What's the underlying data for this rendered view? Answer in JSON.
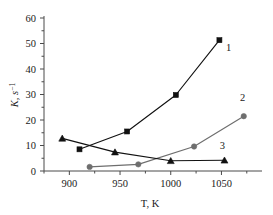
{
  "chart_data": {
    "type": "line",
    "title": "",
    "xlabel": "T, K",
    "ylabel": "K, s",
    "ylabel_sup": "-1",
    "xlim": [
      875,
      1090
    ],
    "ylim": [
      0,
      60
    ],
    "xticks": [
      900,
      950,
      1000,
      1050
    ],
    "yticks": [
      0,
      10,
      20,
      30,
      40,
      50,
      60
    ],
    "grid": false,
    "legend_position": "inline-right-labels",
    "series": [
      {
        "name": "1",
        "marker": "square",
        "color": "#111111",
        "x": [
          910,
          957,
          1005,
          1048
        ],
        "y": [
          8.5,
          15.5,
          29.8,
          51.3
        ]
      },
      {
        "name": "2",
        "marker": "circle",
        "color": "#6e6e6e",
        "x": [
          920,
          968,
          1023,
          1072
        ],
        "y": [
          1.6,
          2.6,
          9.6,
          21.5
        ]
      },
      {
        "name": "3",
        "marker": "triangle",
        "color": "#111111",
        "x": [
          893,
          945,
          1000,
          1053
        ],
        "y": [
          12.8,
          7.4,
          4.0,
          4.2
        ]
      }
    ],
    "annotations": [
      {
        "text": "1",
        "x": 1057,
        "y": 47.0
      },
      {
        "text": "2",
        "x": 1071,
        "y": 27.5
      },
      {
        "text": "3",
        "x": 1051,
        "y": 8.8
      }
    ]
  },
  "axis": {
    "x_title": "T, K",
    "y_title_base": "K, s",
    "y_title_exp": "−1",
    "x_tick_labels": [
      "900",
      "950",
      "1000",
      "1050"
    ],
    "y_tick_labels": [
      "0",
      "10",
      "20",
      "30",
      "40",
      "50",
      "60"
    ]
  },
  "colors": {
    "series1": "#111111",
    "series2": "#6e6e6e",
    "series3": "#111111",
    "axis": "#4a4a4a",
    "text": "#1a1a1a",
    "background": "#ffffff"
  }
}
